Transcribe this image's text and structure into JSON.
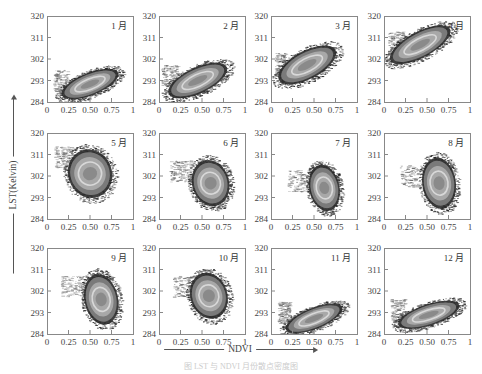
{
  "chart_data": {
    "type": "scatter",
    "subtype": "density-scatter-small-multiples",
    "xlabel": "NDVI",
    "ylabel": "LST(Kelvin)",
    "xlim": [
      0,
      1
    ],
    "ylim": [
      284,
      320
    ],
    "xticks": [
      "0",
      "0.25",
      "0.50",
      "0.75",
      "1"
    ],
    "yticks": [
      "284",
      "293",
      "302",
      "311",
      "320"
    ],
    "grid": false,
    "legend": "none",
    "layout": {
      "rows": 3,
      "cols": 4
    },
    "panels": [
      {
        "label": "1 月",
        "month": 1,
        "center_ndvi": 0.5,
        "center_lst": 291.5,
        "ndvi_range": [
          0.1,
          0.87
        ],
        "lst_range": [
          284,
          299
        ],
        "trend": "negative"
      },
      {
        "label": "2 月",
        "month": 2,
        "center_ndvi": 0.45,
        "center_lst": 293.0,
        "ndvi_range": [
          0.05,
          0.82
        ],
        "lst_range": [
          284,
          301
        ],
        "trend": "negative"
      },
      {
        "label": "3 月",
        "month": 3,
        "center_ndvi": 0.4,
        "center_lst": 301.0,
        "ndvi_range": [
          0.05,
          0.8
        ],
        "lst_range": [
          287,
          307
        ],
        "trend": "negative"
      },
      {
        "label": "4 月",
        "month": 4,
        "center_ndvi": 0.4,
        "center_lst": 310.0,
        "ndvi_range": [
          0.05,
          0.85
        ],
        "lst_range": [
          298,
          316
        ],
        "trend": "negative"
      },
      {
        "label": "5 月",
        "month": 5,
        "center_ndvi": 0.5,
        "center_lst": 305.0,
        "ndvi_range": [
          0.05,
          0.8
        ],
        "lst_range": [
          288,
          313
        ],
        "trend": "negative"
      },
      {
        "label": "6 月",
        "month": 6,
        "center_ndvi": 0.6,
        "center_lst": 300.0,
        "ndvi_range": [
          0.05,
          0.85
        ],
        "lst_range": [
          285,
          308
        ],
        "trend": "negative"
      },
      {
        "label": "7 月",
        "month": 7,
        "center_ndvi": 0.65,
        "center_lst": 298.0,
        "ndvi_range": [
          0.05,
          0.87
        ],
        "lst_range": [
          285,
          306
        ],
        "trend": "negative"
      },
      {
        "label": "8 月",
        "month": 8,
        "center_ndvi": 0.65,
        "center_lst": 300.0,
        "ndvi_range": [
          0.05,
          0.9
        ],
        "lst_range": [
          285,
          310
        ],
        "trend": "negative"
      },
      {
        "label": "9 月",
        "month": 9,
        "center_ndvi": 0.65,
        "center_lst": 300.0,
        "ndvi_range": [
          0.05,
          0.87
        ],
        "lst_range": [
          287,
          310
        ],
        "trend": "negative"
      },
      {
        "label": "10 月",
        "month": 10,
        "center_ndvi": 0.58,
        "center_lst": 301.0,
        "ndvi_range": [
          0.05,
          0.87
        ],
        "lst_range": [
          288,
          309
        ],
        "trend": "negative"
      },
      {
        "label": "11 月",
        "month": 11,
        "center_ndvi": 0.5,
        "center_lst": 291.0,
        "ndvi_range": [
          0.05,
          0.87
        ],
        "lst_range": [
          284,
          298
        ],
        "trend": "negative"
      },
      {
        "label": "12 月",
        "month": 12,
        "center_ndvi": 0.52,
        "center_lst": 292.0,
        "ndvi_range": [
          0.1,
          0.9
        ],
        "lst_range": [
          285,
          298
        ],
        "trend": "negative"
      }
    ]
  },
  "render": {
    "panel_size": 86,
    "col_x": [
      47,
      159,
      271,
      384
    ],
    "row_y": [
      16,
      133,
      248
    ],
    "clouds": [
      {
        "cx": 0.5,
        "cy": 291.5,
        "rx": 0.36,
        "ry": 4.8,
        "rot": 22,
        "tailx": 0.12,
        "taily": 293,
        "tailw": 0.16
      },
      {
        "cx": 0.45,
        "cy": 293.0,
        "rx": 0.38,
        "ry": 5.5,
        "rot": 25,
        "tailx": 0.08,
        "taily": 295,
        "tailw": 0.18
      },
      {
        "cx": 0.42,
        "cy": 299.5,
        "rx": 0.38,
        "ry": 6.0,
        "rot": 28,
        "tailx": 0.08,
        "taily": 300,
        "tailw": 0.12
      },
      {
        "cx": 0.42,
        "cy": 308.0,
        "rx": 0.4,
        "ry": 5.5,
        "rot": 28,
        "tailx": 0.1,
        "taily": 309,
        "tailw": 0.18
      },
      {
        "cx": 0.5,
        "cy": 303.0,
        "rx": 0.26,
        "ry": 10.5,
        "rot": 20,
        "tailx": 0.15,
        "taily": 310,
        "tailw": 0.22
      },
      {
        "cx": 0.6,
        "cy": 299.0,
        "rx": 0.22,
        "ry": 10.0,
        "rot": 15,
        "tailx": 0.2,
        "taily": 304,
        "tailw": 0.26
      },
      {
        "cx": 0.62,
        "cy": 297.0,
        "rx": 0.18,
        "ry": 10.0,
        "rot": 12,
        "tailx": 0.28,
        "taily": 300,
        "tailw": 0.3
      },
      {
        "cx": 0.64,
        "cy": 299.0,
        "rx": 0.2,
        "ry": 11.0,
        "rot": 8,
        "tailx": 0.28,
        "taily": 302,
        "tailw": 0.32
      },
      {
        "cx": 0.63,
        "cy": 298.5,
        "rx": 0.2,
        "ry": 11.0,
        "rot": 12,
        "tailx": 0.25,
        "taily": 304,
        "tailw": 0.3
      },
      {
        "cx": 0.58,
        "cy": 300.0,
        "rx": 0.22,
        "ry": 10.0,
        "rot": 18,
        "tailx": 0.25,
        "taily": 304,
        "tailw": 0.3
      },
      {
        "cx": 0.5,
        "cy": 290.5,
        "rx": 0.36,
        "ry": 4.5,
        "rot": 22,
        "tailx": 0.12,
        "taily": 293,
        "tailw": 0.14
      },
      {
        "cx": 0.52,
        "cy": 292.0,
        "rx": 0.38,
        "ry": 4.5,
        "rot": 18,
        "tailx": 0.12,
        "taily": 294,
        "tailw": 0.16
      }
    ],
    "colors": {
      "frame": "#888888",
      "outer": "#2a2a2a",
      "mid": "#7a7a7a",
      "inner": "#a8a8a8",
      "ring": "#d8d8d8",
      "core": "#8a8a8a",
      "text": "#444444"
    }
  },
  "caption": "图 LST 与 NDVI 月份散点密度图"
}
